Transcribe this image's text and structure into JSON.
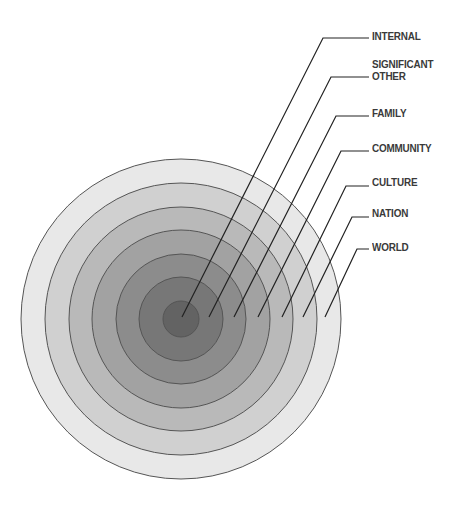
{
  "diagram": {
    "type": "concentric-circles",
    "center": {
      "x": 181,
      "y": 319
    },
    "stroke_color": "#555555",
    "leader_color": "#222222",
    "layers": [
      {
        "id": "world",
        "label": "WORLD",
        "radius": 160,
        "fill": "#e8e8e8",
        "anchor": {
          "x": 325,
          "y": 317
        },
        "bend": {
          "x": 357,
          "y": 249
        },
        "line_end_x": 369,
        "label_y": 241
      },
      {
        "id": "nation",
        "label": "NATION",
        "radius": 136,
        "fill": "#d0d0d0",
        "anchor": {
          "x": 303,
          "y": 317
        },
        "bend": {
          "x": 352,
          "y": 217
        },
        "line_end_x": 369,
        "label_y": 207
      },
      {
        "id": "culture",
        "label": "CULTURE",
        "radius": 112,
        "fill": "#b9b9b9",
        "anchor": {
          "x": 282,
          "y": 317
        },
        "bend": {
          "x": 346,
          "y": 186
        },
        "line_end_x": 369,
        "label_y": 176
      },
      {
        "id": "community",
        "label": "COMMUNITY",
        "radius": 89,
        "fill": "#a2a2a2",
        "anchor": {
          "x": 258,
          "y": 317
        },
        "bend": {
          "x": 341,
          "y": 151
        },
        "line_end_x": 369,
        "label_y": 142
      },
      {
        "id": "family",
        "label": "FAMILY",
        "radius": 65,
        "fill": "#8c8c8c",
        "anchor": {
          "x": 234,
          "y": 317
        },
        "bend": {
          "x": 336,
          "y": 116
        },
        "line_end_x": 369,
        "label_y": 107
      },
      {
        "id": "significant-other",
        "label_line1": "SIGNIFICANT",
        "label_line2": "OTHER",
        "radius": 42,
        "fill": "#777777",
        "anchor": {
          "x": 209,
          "y": 317
        },
        "bend": {
          "x": 331,
          "y": 77
        },
        "line_end_x": 369,
        "label_y": 58
      },
      {
        "id": "internal",
        "label": "INTERNAL",
        "radius": 18,
        "fill": "#636363",
        "anchor": {
          "x": 182,
          "y": 317
        },
        "bend": {
          "x": 323,
          "y": 38
        },
        "line_end_x": 369,
        "label_y": 30
      }
    ]
  }
}
